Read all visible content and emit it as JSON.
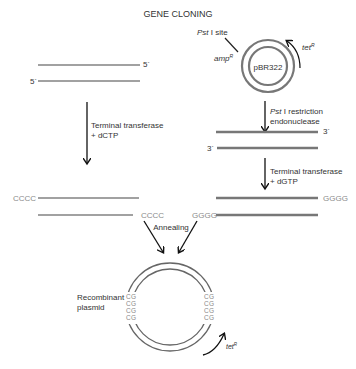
{
  "title": "GENE CLONING",
  "plasmid": {
    "name": "pBR322",
    "pst_site_label": "Pst I site",
    "pst_site_italic": "Pst",
    "pst_site_rest": " I site",
    "amp_label": "amp",
    "amp_sup": "R",
    "tet_label": "tet",
    "tet_sup": "R"
  },
  "left_dna": {
    "top_end": "5´",
    "bottom_end": "5´"
  },
  "steps": {
    "left_step": {
      "line1": "Terminal transferase",
      "line2": "+ dCTP"
    },
    "right_step1": {
      "italic": "Pst",
      "line1_rest": " I restriction",
      "line2": "endonuclease"
    },
    "right_step2": {
      "line1": "Terminal transferase",
      "line2": "+ dGTP"
    },
    "annealing": "Annealing"
  },
  "right_dna": {
    "top_end": "3´",
    "bottom_end": "3´"
  },
  "tails": {
    "left_top": "CCCC",
    "left_bottom": "CCCC",
    "right_top": "GGGG",
    "right_bottom": "GGGG"
  },
  "recombinant": {
    "label_line1": "Recombinant",
    "label_line2": "plasmid",
    "tet_label": "tet",
    "tet_sup": "R",
    "left_tail_outer": [
      "C",
      "C",
      "C",
      "C"
    ],
    "left_tail_inner": [
      "G",
      "G",
      "G",
      "G"
    ],
    "right_tail_outer": [
      "G",
      "G",
      "G",
      "G"
    ],
    "right_tail_inner": [
      "C",
      "C",
      "C",
      "C"
    ]
  }
}
